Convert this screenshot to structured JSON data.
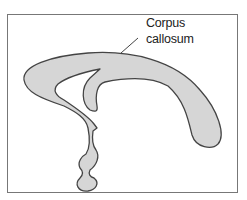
{
  "diagram": {
    "title": "",
    "structure": "corpus-callosum-sagittal-outline",
    "fill_color": "#d6d6d6",
    "stroke_color": "#444444",
    "frame_color": "#777777",
    "label": {
      "line1": "Corpus",
      "line2": "callosum"
    }
  }
}
